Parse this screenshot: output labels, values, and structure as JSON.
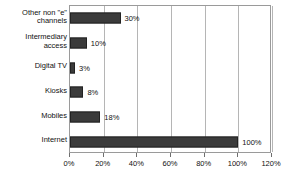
{
  "chart_data": {
    "type": "bar",
    "orientation": "horizontal",
    "title": "",
    "subtitle": "",
    "xlabel": "",
    "ylabel": "",
    "categories": [
      "Other non \"e\" channels",
      "Intermediary access",
      "Digital TV",
      "Kiosks",
      "Mobiles",
      "Internet"
    ],
    "values": [
      30,
      10,
      3,
      8,
      18,
      100
    ],
    "data_labels": [
      "30%",
      "10%",
      "3%",
      "8%",
      "18%",
      "100%"
    ],
    "xlim": [
      0,
      120
    ],
    "xticks": [
      0,
      20,
      40,
      60,
      80,
      100,
      120
    ],
    "xtick_labels": [
      "0%",
      "20%",
      "40%",
      "60%",
      "80%",
      "100%",
      "120%"
    ],
    "grid": "vertical",
    "legend": "none",
    "bar_color": "#3b3b3b",
    "bar_border_color": "#222222",
    "gridline_color": "#b5b5b5",
    "frame_color": "#9a9a9a",
    "text_color": "#111111",
    "background": "#ffffff"
  }
}
